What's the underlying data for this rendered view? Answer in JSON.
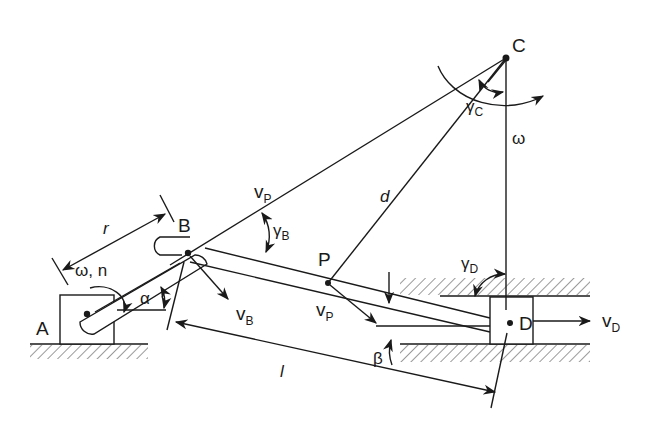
{
  "diagram": {
    "type": "slider-crank mechanism kinematics",
    "points": {
      "A": "A",
      "B": "B",
      "C": "C",
      "D": "D",
      "P": "P"
    },
    "labels": {
      "r": "r",
      "omega_n": "ω, n",
      "alpha": "α",
      "beta": "β",
      "l": "l",
      "d": "d",
      "vB": "v",
      "vB_sub": "B",
      "vP_top": "v",
      "vP_top_sub": "P",
      "vP": "v",
      "vP_sub": "P",
      "vD": "v",
      "vD_sub": "D",
      "gammaB": "γ",
      "gammaB_sub": "B",
      "gammaC": "γ",
      "gammaC_sub": "C",
      "gammaD": "γ",
      "gammaD_sub": "D",
      "omega_C": "ω"
    },
    "colors": {
      "ink": "#1a1a1a",
      "background": "#ffffff"
    }
  }
}
